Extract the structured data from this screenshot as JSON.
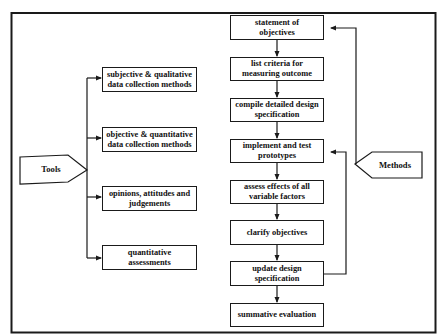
{
  "diagram": {
    "type": "flowchart",
    "colors": {
      "line": "#1a1a1a",
      "background": "#ffffff"
    },
    "tools": {
      "label": "Tools",
      "items": [
        {
          "id": "tool-1",
          "label": "subjective & qualitative data collection methods"
        },
        {
          "id": "tool-2",
          "label": "objective & quantitative data collection methods"
        },
        {
          "id": "tool-3",
          "label": "opinions, attitudes and judgements"
        },
        {
          "id": "tool-4",
          "label": "quantitative assessments"
        }
      ]
    },
    "methods": {
      "label": "Methods",
      "steps": [
        {
          "id": "step-1",
          "label": "statement of objectives"
        },
        {
          "id": "step-2",
          "label": "list criteria for measuring outcome"
        },
        {
          "id": "step-3",
          "label": "compile detailed design specification"
        },
        {
          "id": "step-4",
          "label": "implement and test prototypes"
        },
        {
          "id": "step-5",
          "label": "assess effects of all variable factors"
        },
        {
          "id": "step-6",
          "label": "clarify objectives"
        },
        {
          "id": "step-7",
          "label": "update design specification"
        },
        {
          "id": "step-8",
          "label": "summative evaluation"
        }
      ],
      "loops": [
        {
          "from": "methods",
          "to": "step-1"
        },
        {
          "from": "step-7",
          "to": "step-4"
        }
      ]
    }
  }
}
